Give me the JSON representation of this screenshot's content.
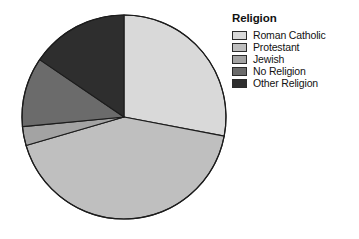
{
  "chart_data": {
    "type": "pie",
    "title": "Religion",
    "legend_title": "Religion",
    "legend_position": "right",
    "categories": [
      "Roman Catholic",
      "Protestant",
      "Jewish",
      "No Religion",
      "Other Religion"
    ],
    "values": [
      28,
      42.5,
      3,
      11,
      15.5
    ],
    "units": "percent",
    "start_angle_deg": 0,
    "direction": "clockwise",
    "slice_colors": [
      "#d9d9d9",
      "#bfbfbf",
      "#a3a3a3",
      "#6b6b6b",
      "#2e2e2e"
    ],
    "slice_boundaries_deg": [
      0,
      100.8,
      253.8,
      264.6,
      304.2,
      360
    ],
    "stroke_color": "#1c1c1c",
    "grid": false,
    "xlabel": "",
    "ylabel": "",
    "annotations": []
  },
  "legend": {
    "title": "Religion",
    "items": [
      {
        "label": "Roman Catholic",
        "color": "#d9d9d9"
      },
      {
        "label": "Protestant",
        "color": "#bfbfbf"
      },
      {
        "label": "Jewish",
        "color": "#a3a3a3"
      },
      {
        "label": "No Religion",
        "color": "#6b6b6b"
      },
      {
        "label": "Other Religion",
        "color": "#2e2e2e"
      }
    ]
  },
  "pie_geometry": {
    "center_x": 124,
    "center_y": 117,
    "radius": 102
  }
}
